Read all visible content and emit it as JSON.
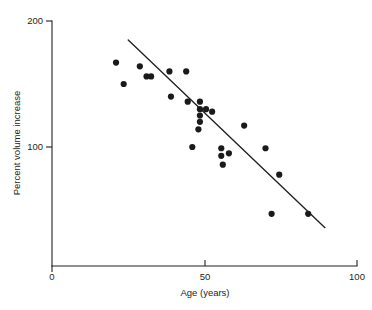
{
  "chart_data": {
    "type": "scatter",
    "title": "",
    "xlabel": "Age (years)",
    "ylabel": "Percent volume increase",
    "xlim": [
      0,
      100
    ],
    "ylim": [
      0,
      200
    ],
    "xticks": [
      0,
      50,
      100
    ],
    "xticklabels": [
      "0",
      "50",
      "100"
    ],
    "yticks": [
      100,
      200
    ],
    "yticklabels": [
      "100",
      "200"
    ],
    "grid": false,
    "legend": null,
    "marker_color": "#1a1a1a",
    "line_color": "#231f20",
    "axis_color": "#231f20",
    "points": [
      {
        "x": 21.0,
        "y": 167
      },
      {
        "x": 23.5,
        "y": 150
      },
      {
        "x": 28.8,
        "y": 164
      },
      {
        "x": 31.0,
        "y": 156
      },
      {
        "x": 32.5,
        "y": 156
      },
      {
        "x": 38.5,
        "y": 160
      },
      {
        "x": 44.0,
        "y": 160
      },
      {
        "x": 39.0,
        "y": 140
      },
      {
        "x": 44.5,
        "y": 136
      },
      {
        "x": 48.5,
        "y": 136
      },
      {
        "x": 48.5,
        "y": 130
      },
      {
        "x": 48.5,
        "y": 125
      },
      {
        "x": 48.5,
        "y": 120
      },
      {
        "x": 50.5,
        "y": 130
      },
      {
        "x": 52.5,
        "y": 128
      },
      {
        "x": 48.0,
        "y": 114
      },
      {
        "x": 46.0,
        "y": 100
      },
      {
        "x": 55.5,
        "y": 99
      },
      {
        "x": 55.5,
        "y": 93
      },
      {
        "x": 58.0,
        "y": 95
      },
      {
        "x": 56.0,
        "y": 86
      },
      {
        "x": 63.0,
        "y": 117
      },
      {
        "x": 70.0,
        "y": 99
      },
      {
        "x": 74.5,
        "y": 78
      },
      {
        "x": 72.0,
        "y": 47
      },
      {
        "x": 84.0,
        "y": 47
      }
    ],
    "fit_line": {
      "x_start": 25.0,
      "y_start": 185,
      "x_end": 89.5,
      "y_end": 36
    }
  }
}
